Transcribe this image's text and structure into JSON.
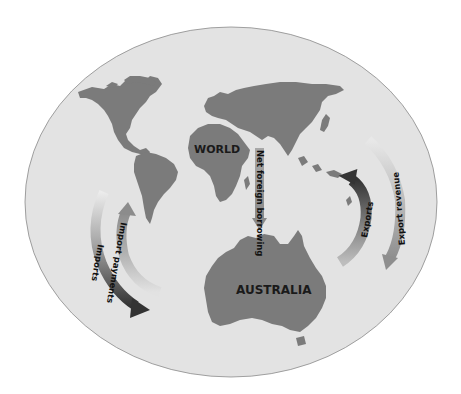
{
  "diagram": {
    "type": "circular-flow",
    "background_color": "#ffffff",
    "ellipse": {
      "fill": "#e3e3e3",
      "stroke": "#8a8a8a"
    },
    "land_color": "#7b7b7b",
    "regions": {
      "world": {
        "label": "WORLD"
      },
      "australia": {
        "label": "AUSTRALIA"
      }
    },
    "flows": [
      {
        "id": "imports",
        "label": "Imports",
        "direction": "world-to-australia",
        "side": "left-outer",
        "color_start": "#e6e6e6",
        "color_end": "#3a3a3a"
      },
      {
        "id": "import-payments",
        "label": "Import payments",
        "direction": "australia-to-world",
        "side": "left-inner",
        "color_start": "#e0e0e0",
        "color_end": "#8a8a8a"
      },
      {
        "id": "net-foreign-borrowing",
        "label": "Net foreign borrowing",
        "direction": "world-to-australia",
        "side": "center",
        "color_start": "#a0a0a0",
        "color_end": "#8a8a8a"
      },
      {
        "id": "exports",
        "label": "Exports",
        "direction": "australia-to-world",
        "side": "right-inner",
        "color_start": "#b5b5b5",
        "color_end": "#3a3a3a"
      },
      {
        "id": "export-revenue",
        "label": "Export revenue",
        "direction": "world-to-australia",
        "side": "right-outer",
        "color_start": "#e0e0e0",
        "color_end": "#8e8e8e"
      }
    ]
  }
}
